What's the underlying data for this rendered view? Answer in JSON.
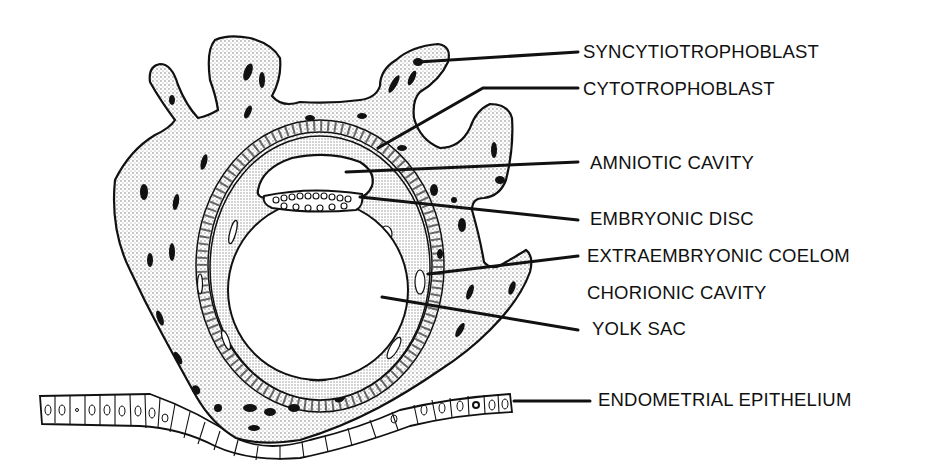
{
  "diagram": {
    "type": "labeled biological cross-section",
    "labels": [
      {
        "id": "syncytiotrophoblast",
        "text": "SYNCYTIOTROPHOBLAST",
        "x": 583,
        "y": 53,
        "line": [
          [
            418,
            62
          ],
          [
            578,
            52
          ]
        ]
      },
      {
        "id": "cytotrophoblast",
        "text": "CYTOTROPHOBLAST",
        "x": 583,
        "y": 92,
        "line": [
          [
            378,
            148
          ],
          [
            483,
            88
          ],
          [
            578,
            88
          ]
        ]
      },
      {
        "id": "amniotic-cavity",
        "text": "AMNIOTIC CAVITY",
        "x": 590,
        "y": 168,
        "line": [
          [
            346,
            172
          ],
          [
            578,
            162
          ]
        ]
      },
      {
        "id": "embryonic-disc",
        "text": "EMBRYONIC DISC",
        "x": 590,
        "y": 223,
        "line": [
          [
            360,
            197
          ],
          [
            578,
            220
          ]
        ]
      },
      {
        "id": "extraembryonic-coelom",
        "text": "EXTRAEMBRYONIC COELOM",
        "x": 587,
        "y": 262,
        "line": [
          [
            428,
            274
          ],
          [
            578,
            256
          ]
        ]
      },
      {
        "id": "chorionic-cavity",
        "text": "CHORIONIC CAVITY",
        "x": 587,
        "y": 299,
        "line": null
      },
      {
        "id": "yolk-sac",
        "text": "YOLK SAC",
        "x": 592,
        "y": 335,
        "line": [
          [
            382,
            297
          ],
          [
            578,
            330
          ]
        ]
      },
      {
        "id": "endometrial-epithelium",
        "text": "ENDOMETRIAL EPITHELIUM",
        "x": 598,
        "y": 406,
        "line": [
          [
            514,
            401
          ],
          [
            590,
            401
          ]
        ]
      }
    ]
  }
}
